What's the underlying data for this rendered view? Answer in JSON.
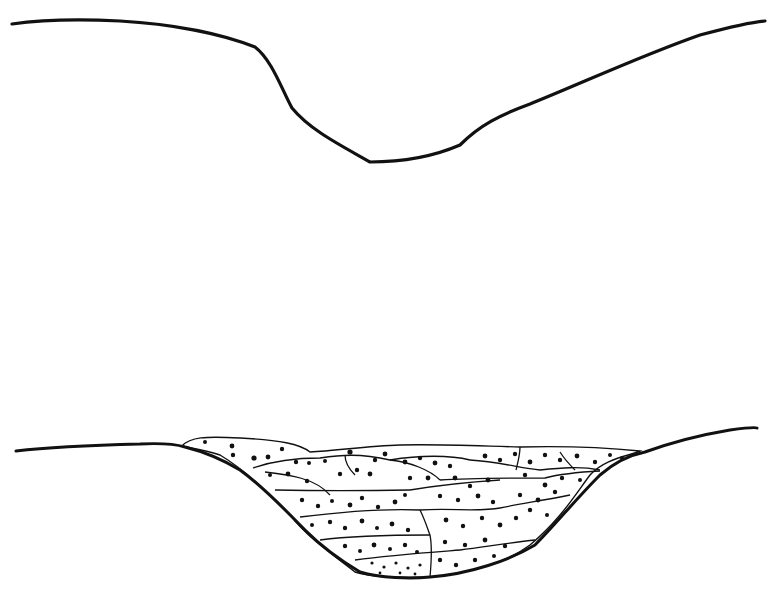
{
  "figure": {
    "panels": [
      {
        "name": "empty-valley-profile",
        "description": "Cross-section of an open V-shaped valley"
      },
      {
        "name": "filled-valley-profile",
        "description": "Cross-section of valley partially filled with stacked sediment lenses (conglomerate/gravel fill)"
      }
    ],
    "colors": {
      "ink": "#111111",
      "background": "#ffffff"
    }
  }
}
